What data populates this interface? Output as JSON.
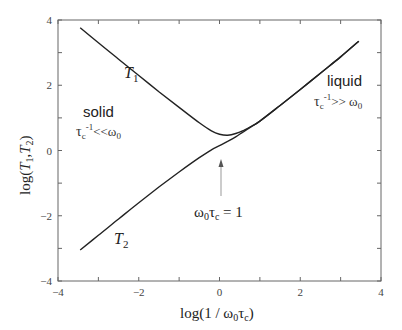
{
  "chart_data": {
    "type": "line",
    "title": "",
    "xlabel": "log(1 / ω0τc)",
    "ylabel": "log(T1,T2)",
    "xlim": [
      -4,
      4
    ],
    "ylim": [
      -4,
      4
    ],
    "x_ticks": [
      -4,
      -2,
      0,
      2,
      4
    ],
    "y_ticks": [
      -4,
      -2,
      0,
      2,
      4
    ],
    "x_minor_ticks": [
      -3,
      -1,
      1,
      3
    ],
    "y_minor_ticks": [
      -3,
      -1,
      1,
      3
    ],
    "grid": false,
    "legend": "none (inline labels)",
    "series": [
      {
        "name": "T1",
        "x": [
          -3.45,
          -3.0,
          -2.5,
          -2.0,
          -1.5,
          -1.0,
          -0.5,
          -0.2,
          0.0,
          0.2,
          0.4,
          0.6,
          0.8,
          1.0,
          1.5,
          2.0,
          2.5,
          3.0,
          3.45
        ],
        "values": [
          3.76,
          3.3,
          2.8,
          2.3,
          1.8,
          1.32,
          0.85,
          0.6,
          0.5,
          0.47,
          0.52,
          0.62,
          0.75,
          0.9,
          1.38,
          1.87,
          2.37,
          2.87,
          3.35
        ]
      },
      {
        "name": "T2",
        "x": [
          -3.45,
          -3.0,
          -2.5,
          -2.0,
          -1.5,
          -1.0,
          -0.5,
          -0.2,
          0.0,
          0.2,
          0.4,
          0.6,
          0.8,
          1.0,
          1.5,
          2.0,
          2.5,
          3.0,
          3.45
        ],
        "values": [
          -3.05,
          -2.6,
          -2.1,
          -1.6,
          -1.12,
          -0.66,
          -0.22,
          0.02,
          0.15,
          0.28,
          0.42,
          0.58,
          0.74,
          0.9,
          1.38,
          1.87,
          2.37,
          2.87,
          3.35
        ]
      }
    ],
    "annotations": [
      {
        "text": "T1",
        "x": -2.3,
        "y": 2.9
      },
      {
        "text": "T2",
        "x": -2.6,
        "y": -2.5
      },
      {
        "text": "solid",
        "x": -2.7,
        "y": 1.1
      },
      {
        "text": "τc-1 << ω0",
        "x": -2.7,
        "y": 0.4
      },
      {
        "text": "liquid",
        "x": 2.8,
        "y": 2.1
      },
      {
        "text": "τc-1 >> ω0",
        "x": 2.8,
        "y": 1.4
      },
      {
        "text": "ω0τc = 1",
        "x": 0.2,
        "y": -1.9,
        "arrow_to": [
          0.0,
          0.1
        ]
      }
    ]
  },
  "labels": {
    "xlabel_main": "log(1 / ω",
    "xlabel_sub0": "0",
    "xlabel_tau": "τ",
    "xlabel_subc": "c",
    "xlabel_close": ")",
    "ylabel_prefix": "log(",
    "ylabel_T": "T",
    "ylabel_sub1": "1",
    "ylabel_comma": ",",
    "ylabel_sub2": "2",
    "ylabel_close": ")",
    "t1": "T",
    "t1_sub": "1",
    "t2": "T",
    "t2_sub": "2",
    "solid": "solid",
    "solid_cond_tau": "τ",
    "solid_cond_c": "c",
    "solid_cond_exp": "-1",
    "solid_cond_rel": "<<ω",
    "solid_cond_0": "0",
    "liquid": "liquid",
    "liquid_cond_tau": "τ",
    "liquid_cond_c": "c",
    "liquid_cond_exp": "-1",
    "liquid_cond_rel": ">> ω",
    "liquid_cond_0": "0",
    "crossover_omega": "ω",
    "crossover_0": "0",
    "crossover_tau": "τ",
    "crossover_c": "c",
    "crossover_eq": " = 1"
  }
}
